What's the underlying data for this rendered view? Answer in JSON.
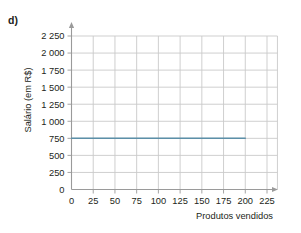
{
  "item_label": "d)",
  "axes": {
    "y_title": "Salário (em R$)",
    "x_title": "Produtos vendidos"
  },
  "colors": {
    "line": "#5b8fa8",
    "grid": "#c9c9c9",
    "axis": "#9a9a9a",
    "text": "#231f20",
    "background": "#ffffff"
  },
  "chart_data": {
    "type": "line",
    "title": "",
    "subtitle": "",
    "xlabel": "Produtos vendidos",
    "ylabel": "Salário (em R$)",
    "xlim": [
      0,
      237
    ],
    "ylim": [
      0,
      2375
    ],
    "grid": true,
    "legend": "none",
    "x_ticks": [
      0,
      25,
      50,
      75,
      100,
      125,
      150,
      175,
      200,
      225
    ],
    "x_tick_labels": [
      "0",
      "25",
      "50",
      "75",
      "100",
      "125",
      "150",
      "175",
      "200",
      "225"
    ],
    "y_ticks": [
      0,
      250,
      500,
      750,
      1000,
      1250,
      1500,
      1750,
      2000,
      2250
    ],
    "y_tick_labels": [
      "0",
      "250",
      "500",
      "750",
      "1 000",
      "1 250",
      "1 500",
      "1 750",
      "2 000",
      "2 250"
    ],
    "series": [
      {
        "name": "Salário",
        "color": "#5b8fa8",
        "x": [
          0,
          25,
          50,
          75,
          100,
          125,
          150,
          175,
          200
        ],
        "values": [
          750,
          750,
          750,
          750,
          750,
          750,
          750,
          750,
          750
        ]
      }
    ],
    "annotations": [
      "d)"
    ]
  }
}
